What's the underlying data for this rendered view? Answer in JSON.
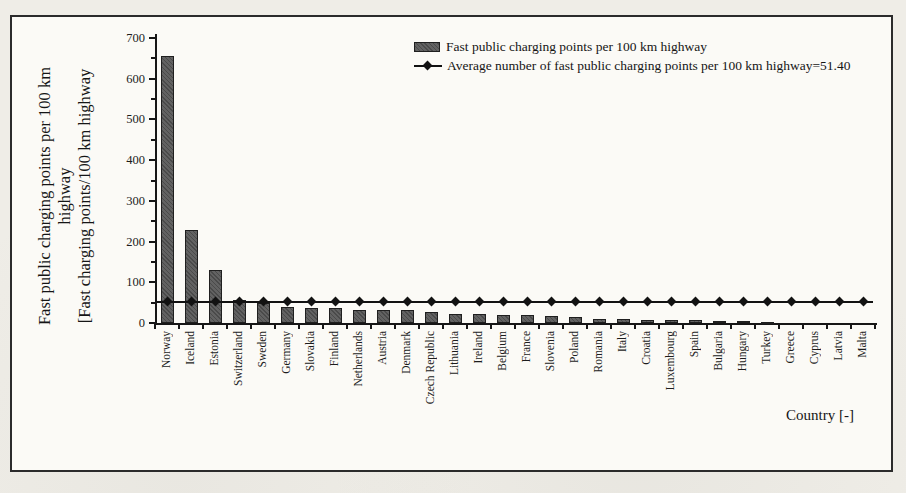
{
  "figure": {
    "page_background": "#efede7",
    "panel_background": "#fbfaf6",
    "panel_border_color": "#2b2b2b"
  },
  "colors": {
    "bar_fill": "#5a5a5a",
    "bar_border": "#1f1f1f",
    "average_line": "#121212",
    "text": "#1c1c1c"
  },
  "legend": {
    "items": [
      {
        "label": "Fast public charging points per 100 km highway",
        "swatch": "bar-swatch"
      },
      {
        "label": "Average number of fast public charging points per 100 km highway=51.40",
        "swatch": "line-diamond-swatch"
      }
    ]
  },
  "chart_data": {
    "type": "bar",
    "title": "",
    "xlabel": "Country [-]",
    "ylabel_lines": [
      "Fast public charging points per 100 km",
      "highway",
      "[Fast charging points/100 km highway"
    ],
    "ylim": [
      0,
      700
    ],
    "yticks": [
      0,
      100,
      200,
      300,
      400,
      500,
      600,
      700
    ],
    "ytick_minor_interval": 50,
    "grid": false,
    "legend_position": "top-center",
    "categories": [
      "Norway",
      "Iceland",
      "Estonia",
      "Switzerland",
      "Sweden",
      "Germany",
      "Slovakia",
      "Finland",
      "Netherlands",
      "Austria",
      "Denmark",
      "Czech Republic",
      "Lithuania",
      "Ireland",
      "Belgium",
      "France",
      "Slovenia",
      "Poland",
      "Romania",
      "Italy",
      "Croatia",
      "Luxembourg",
      "Spain",
      "Bulgaria",
      "Hungary",
      "Turkey",
      "Greece",
      "Cyprus",
      "Latvia",
      "Malta"
    ],
    "series": [
      {
        "name": "Fast public charging points per 100 km highway",
        "type": "bar",
        "color": "#5a5a5a",
        "values": [
          655,
          228,
          130,
          57,
          50,
          40,
          38,
          36,
          33,
          31,
          32,
          26,
          23,
          21,
          20,
          19,
          17,
          14,
          11,
          9,
          8,
          7,
          6.5,
          6,
          4,
          2,
          1.2,
          0.8,
          0.5,
          0.2
        ]
      },
      {
        "name": "Average number of fast public charging points per 100 km highway=51.40",
        "type": "line",
        "marker": "diamond",
        "color": "#121212",
        "value": 51.4
      }
    ],
    "average_value": 51.4
  }
}
